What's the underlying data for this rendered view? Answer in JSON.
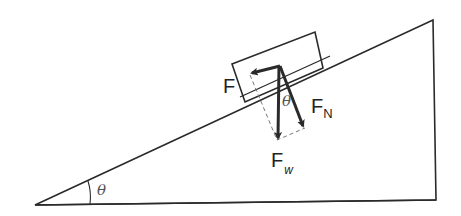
{
  "diagram": {
    "labels": {
      "friction": "F",
      "normal_main": "F",
      "normal_sub": "N",
      "weight_main": "F",
      "weight_sub": "w",
      "angle_incline": "θ",
      "angle_forces": "θ"
    },
    "colors": {
      "line": "#2a2a2a",
      "dashed": "#777777",
      "background": "#ffffff"
    }
  }
}
